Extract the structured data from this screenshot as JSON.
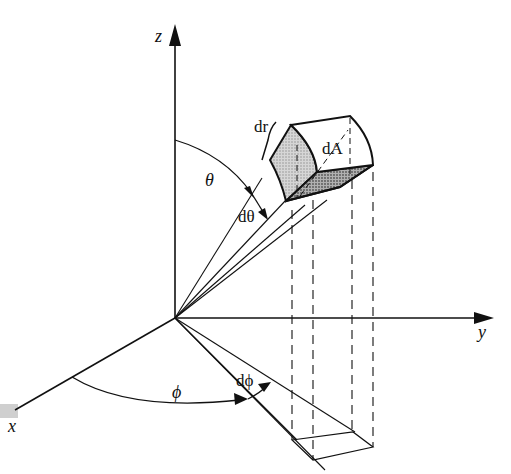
{
  "diagram": {
    "axes": {
      "z": "z",
      "y": "y",
      "x": "x"
    },
    "labels": {
      "theta": "θ",
      "dtheta": "dθ",
      "phi": "ϕ",
      "dphi": "dϕ",
      "dr": "dr",
      "dA": "dA"
    },
    "colors": {
      "line": "#111111",
      "shade_light": "#c8c8c8",
      "shade_dark": "#9a9a9a",
      "background": "#ffffff"
    }
  }
}
